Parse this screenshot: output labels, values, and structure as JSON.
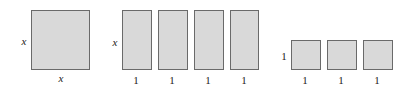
{
  "groups": [
    {
      "name": "x-squared-tile",
      "side_label": "x",
      "bottom_labels": [
        "x"
      ]
    },
    {
      "name": "x-tiles",
      "side_label": "x",
      "bottom_labels": [
        "1",
        "1",
        "1",
        "1"
      ]
    },
    {
      "name": "unit-tiles",
      "side_label": "1",
      "bottom_labels": [
        "1",
        "1",
        "1"
      ]
    }
  ],
  "colors": {
    "tile_fill": "#d9d9d9",
    "tile_border": "#6a6a6a"
  }
}
